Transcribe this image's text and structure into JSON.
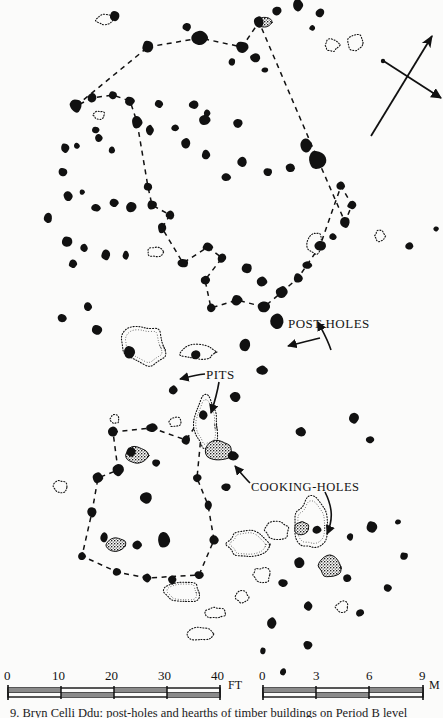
{
  "figure": {
    "type": "archaeological-site-plan",
    "background_color": "#fbfbfa",
    "ink_color": "#111111",
    "caption": "9.  Bryn Celli Ddu: post-holes and hearths of timber buildings on Period B level"
  },
  "annotations": {
    "post_holes_label": "POST-HOLES",
    "pits_label": "PITS",
    "cooking_holes_label": "COOKING-HOLES"
  },
  "north_arrow": {
    "name": "north-arrow",
    "description": "long diagonal arrow pointing up-right crossed by a shorter bar"
  },
  "scale_feet": {
    "unit": "FT",
    "ticks": [
      "0",
      "10",
      "20",
      "30",
      "40"
    ]
  },
  "scale_metres": {
    "unit": "M",
    "ticks": [
      "0",
      "3",
      "6",
      "9"
    ]
  },
  "chart_data": {
    "type": "scatter",
    "xlabel": "",
    "ylabel": "",
    "grid": false,
    "legend": "none",
    "note": "Plan-view archaeological distribution map. Solid blobs = post-holes; dotted outlines = pits; stippled fills = cooking-holes; dashed polylines = inferred timber building outlines.",
    "series": [
      {
        "name": "post-holes",
        "marker": "filled-blob",
        "points": [
          [
            148,
            47,
            5.5
          ],
          [
            200,
            38,
            7.5
          ],
          [
            242,
            47,
            6.5
          ],
          [
            259,
            22,
            5.0
          ],
          [
            277,
            11,
            4.5
          ],
          [
            232,
            62,
            4.0
          ],
          [
            255,
            58,
            4.5
          ],
          [
            265,
            70,
            3.0
          ],
          [
            298,
            5,
            5.5
          ],
          [
            320,
            13,
            4.0
          ],
          [
            312,
            28,
            3.0
          ],
          [
            187,
            27,
            4.5
          ],
          [
            115,
            16,
            4.5
          ],
          [
            76,
            106,
            6.5
          ],
          [
            92,
            98,
            5.0
          ],
          [
            113,
            95,
            4.0
          ],
          [
            130,
            101,
            4.5
          ],
          [
            159,
            104,
            4.5
          ],
          [
            194,
            105,
            4.5
          ],
          [
            207,
            113,
            4.0
          ],
          [
            96,
            130,
            4.0
          ],
          [
            65,
            148,
            5.0
          ],
          [
            77,
            146,
            3.0
          ],
          [
            99,
            138,
            4.0
          ],
          [
            112,
            150,
            3.5
          ],
          [
            137,
            122,
            5.5
          ],
          [
            150,
            130,
            4.5
          ],
          [
            175,
            128,
            3.5
          ],
          [
            63,
            172,
            4.0
          ],
          [
            68,
            196,
            5.5
          ],
          [
            82,
            192,
            3.0
          ],
          [
            96,
            208,
            4.0
          ],
          [
            114,
            203,
            4.5
          ],
          [
            131,
            207,
            5.0
          ],
          [
            48,
            218,
            5.0
          ],
          [
            67,
            242,
            5.0
          ],
          [
            84,
            248,
            3.5
          ],
          [
            73,
            264,
            4.0
          ],
          [
            106,
            255,
            5.5
          ],
          [
            126,
            255,
            4.0
          ],
          [
            148,
            187,
            5.0
          ],
          [
            152,
            205,
            5.5
          ],
          [
            170,
            215,
            4.5
          ],
          [
            162,
            228,
            5.0
          ],
          [
            183,
            263,
            5.0
          ],
          [
            208,
            247,
            5.0
          ],
          [
            222,
            258,
            4.5
          ],
          [
            205,
            280,
            4.0
          ],
          [
            247,
            268,
            4.5
          ],
          [
            262,
            282,
            5.0
          ],
          [
            237,
            300,
            5.0
          ],
          [
            211,
            308,
            4.5
          ],
          [
            264,
            307,
            5.5
          ],
          [
            277,
            321,
            8.0
          ],
          [
            282,
            292,
            6.5
          ],
          [
            298,
            278,
            5.0
          ],
          [
            307,
            265,
            4.5
          ],
          [
            320,
            246,
            5.5
          ],
          [
            333,
            237,
            4.0
          ],
          [
            345,
            222,
            5.0
          ],
          [
            352,
            205,
            4.5
          ],
          [
            341,
            186,
            5.0
          ],
          [
            318,
            160,
            9.0
          ],
          [
            306,
            145,
            6.5
          ],
          [
            290,
            168,
            5.0
          ],
          [
            268,
            172,
            4.5
          ],
          [
            242,
            162,
            5.5
          ],
          [
            226,
            177,
            4.5
          ],
          [
            206,
            155,
            5.0
          ],
          [
            238,
            123,
            5.0
          ],
          [
            205,
            120,
            5.0
          ],
          [
            186,
            143,
            4.5
          ],
          [
            130,
            352,
            5.5
          ],
          [
            97,
            330,
            5.0
          ],
          [
            88,
            307,
            4.5
          ],
          [
            62,
            318,
            4.5
          ],
          [
            245,
            345,
            6.0
          ],
          [
            262,
            370,
            5.5
          ],
          [
            235,
            397,
            5.0
          ],
          [
            196,
            355,
            5.0
          ],
          [
            173,
            390,
            4.5
          ],
          [
            203,
            415,
            4.5
          ],
          [
            113,
            432,
            5.0
          ],
          [
            152,
            428,
            5.0
          ],
          [
            186,
            440,
            4.5
          ],
          [
            131,
            452,
            5.0
          ],
          [
            156,
            463,
            4.5
          ],
          [
            118,
            470,
            5.5
          ],
          [
            98,
            478,
            5.0
          ],
          [
            92,
            512,
            4.5
          ],
          [
            104,
            537,
            4.5
          ],
          [
            82,
            556,
            4.0
          ],
          [
            117,
            572,
            4.5
          ],
          [
            147,
            578,
            4.5
          ],
          [
            172,
            580,
            4.0
          ],
          [
            199,
            575,
            4.5
          ],
          [
            214,
            540,
            4.0
          ],
          [
            208,
            505,
            4.5
          ],
          [
            197,
            478,
            4.5
          ],
          [
            233,
            456,
            5.0
          ],
          [
            226,
            487,
            4.5
          ],
          [
            146,
            498,
            5.5
          ],
          [
            164,
            540,
            7.0
          ],
          [
            137,
            545,
            5.0
          ],
          [
            301,
            432,
            4.5
          ],
          [
            354,
            418,
            5.5
          ],
          [
            370,
            440,
            4.0
          ],
          [
            317,
            530,
            4.5
          ],
          [
            350,
            537,
            4.0
          ],
          [
            372,
            527,
            5.5
          ],
          [
            299,
            563,
            5.0
          ],
          [
            347,
            578,
            4.0
          ],
          [
            283,
            583,
            4.5
          ],
          [
            308,
            606,
            4.5
          ],
          [
            272,
            623,
            5.0
          ],
          [
            360,
            613,
            4.5
          ],
          [
            404,
            556,
            4.0
          ],
          [
            283,
            672,
            3.5
          ],
          [
            308,
            645,
            4.5
          ],
          [
            263,
            651,
            3.0
          ],
          [
            388,
            588,
            3.5
          ],
          [
            398,
            522,
            3.0
          ],
          [
            409,
            246,
            3.5
          ],
          [
            436,
            229,
            3.0
          ]
        ]
      },
      {
        "name": "pits",
        "marker": "dotted-outline",
        "points": [
          [
            105,
            20,
            20,
            11
          ],
          [
            155,
            252,
            16,
            10
          ],
          [
            99,
            115,
            12,
            9
          ],
          [
            144,
            345,
            50,
            44
          ],
          [
            198,
            352,
            38,
            15
          ],
          [
            206,
            424,
            26,
            58
          ],
          [
            247,
            544,
            44,
            30
          ],
          [
            311,
            525,
            34,
            58
          ],
          [
            278,
            530,
            28,
            18
          ],
          [
            183,
            592,
            40,
            22
          ],
          [
            216,
            613,
            22,
            12
          ],
          [
            262,
            575,
            20,
            16
          ],
          [
            200,
            634,
            26,
            14
          ],
          [
            332,
            45,
            16,
            13
          ],
          [
            355,
            42,
            16,
            18
          ],
          [
            315,
            243,
            16,
            26
          ],
          [
            380,
            236,
            11,
            12
          ],
          [
            60,
            487,
            14,
            14
          ],
          [
            175,
            422,
            14,
            11
          ],
          [
            115,
            419,
            10,
            10
          ],
          [
            242,
            597,
            14,
            12
          ],
          [
            342,
            607,
            14,
            12
          ]
        ]
      },
      {
        "name": "cooking-holes",
        "marker": "stippled-fill",
        "points": [
          [
            219,
            451,
            26,
            22
          ],
          [
            302,
            528,
            16,
            14
          ],
          [
            330,
            566,
            24,
            22
          ],
          [
            137,
            455,
            22,
            18
          ],
          [
            116,
            545,
            20,
            14
          ],
          [
            265,
            22,
            13,
            11
          ]
        ]
      }
    ],
    "structures": [
      {
        "name": "upper-building-outline",
        "style": "dashed-polyline",
        "vertices": [
          [
            148,
            47
          ],
          [
            200,
            38
          ],
          [
            242,
            47
          ],
          [
            259,
            22
          ],
          [
            318,
            160
          ],
          [
            345,
            222
          ],
          [
            352,
            205
          ],
          [
            341,
            186
          ],
          [
            320,
            246
          ],
          [
            307,
            265
          ],
          [
            298,
            278
          ],
          [
            282,
            292
          ],
          [
            264,
            307
          ],
          [
            237,
            300
          ],
          [
            211,
            308
          ],
          [
            205,
            280
          ],
          [
            222,
            258
          ],
          [
            208,
            247
          ],
          [
            183,
            263
          ],
          [
            162,
            228
          ],
          [
            170,
            215
          ],
          [
            152,
            205
          ],
          [
            148,
            187
          ],
          [
            137,
            122
          ],
          [
            130,
            101
          ],
          [
            113,
            95
          ],
          [
            92,
            98
          ],
          [
            76,
            106
          ],
          [
            148,
            47
          ]
        ]
      },
      {
        "name": "lower-building-outline",
        "style": "dashed-polyline",
        "vertices": [
          [
            113,
            432
          ],
          [
            152,
            428
          ],
          [
            186,
            440
          ],
          [
            203,
            415
          ],
          [
            197,
            478
          ],
          [
            208,
            505
          ],
          [
            214,
            540
          ],
          [
            199,
            575
          ],
          [
            147,
            578
          ],
          [
            117,
            572
          ],
          [
            82,
            556
          ],
          [
            92,
            512
          ],
          [
            98,
            478
          ],
          [
            118,
            470
          ],
          [
            113,
            432
          ]
        ]
      }
    ]
  }
}
